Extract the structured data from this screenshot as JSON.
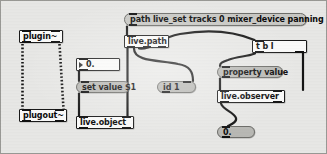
{
  "window": {
    "kind": "max-patcher",
    "background_color": "#e8e8e6",
    "border_color": "#9a9a96",
    "width": 327,
    "height": 154
  },
  "objects": {
    "plugin": {
      "text": "plugin~",
      "type": "object",
      "x": 19,
      "y": 30,
      "w": 44,
      "h": 13,
      "inlets": 2,
      "outlets": 2
    },
    "plugout": {
      "text": "plugout~",
      "type": "object",
      "x": 19,
      "y": 109,
      "w": 48,
      "h": 13,
      "inlets": 2,
      "outlets": 0
    },
    "numberbox": {
      "text": "0.",
      "type": "number",
      "x": 76,
      "y": 58,
      "w": 44,
      "h": 13,
      "inlets": 1,
      "outlets": 1
    },
    "set_value": {
      "text": "set value $1",
      "type": "message",
      "x": 76,
      "y": 81,
      "w": 54,
      "h": 12,
      "inlets": 1,
      "outlets": 1
    },
    "live_object": {
      "text": "live.object",
      "type": "object",
      "x": 76,
      "y": 116,
      "w": 58,
      "h": 13,
      "inlets": 2,
      "outlets": 2
    },
    "path_message": {
      "text": "path live_set tracks 0 mixer_device panning",
      "type": "message",
      "x": 124,
      "y": 13,
      "w": 183,
      "h": 13,
      "inlets": 1,
      "outlets": 1
    },
    "live_path": {
      "text": "live.path",
      "type": "object",
      "x": 124,
      "y": 35,
      "w": 45,
      "h": 13,
      "inlets": 1,
      "outlets": 3
    },
    "id_1": {
      "text": "id 1",
      "type": "message",
      "x": 157,
      "y": 81,
      "w": 39,
      "h": 12,
      "inlets": 1,
      "outlets": 1
    },
    "t_b_l": {
      "text": "t b l",
      "type": "object",
      "x": 252,
      "y": 40,
      "w": 55,
      "h": 13,
      "inlets": 1,
      "outlets": 2
    },
    "property_value": {
      "text": "property value",
      "type": "message",
      "x": 217,
      "y": 66,
      "w": 66,
      "h": 12,
      "inlets": 1,
      "outlets": 1
    },
    "live_observer": {
      "text": "live.observer",
      "type": "object",
      "x": 217,
      "y": 90,
      "w": 68,
      "h": 13,
      "inlets": 2,
      "outlets": 2
    },
    "observer_output": {
      "text": "0.",
      "type": "message",
      "x": 217,
      "y": 126,
      "w": 38,
      "h": 12,
      "inlets": 1,
      "outlets": 1
    }
  },
  "connections": [
    {
      "name": "plugin-left-to-plugout-left",
      "signal": true
    },
    {
      "name": "plugin-right-to-plugout-right",
      "signal": true
    },
    {
      "name": "numberbox-to-set-value",
      "signal": false
    },
    {
      "name": "set-value-to-live-object",
      "signal": false
    },
    {
      "name": "path-message-to-live-path",
      "signal": false
    },
    {
      "name": "live-path-out0-to-live-object-right",
      "signal": false
    },
    {
      "name": "live-path-out1-to-id-1",
      "signal": false
    },
    {
      "name": "live-path-out2-to-t-b-l",
      "signal": false
    },
    {
      "name": "t-b-l-out0-to-property-value",
      "signal": false
    },
    {
      "name": "t-b-l-out1-to-live-observer-right",
      "signal": false
    },
    {
      "name": "property-value-to-live-observer",
      "signal": false
    },
    {
      "name": "live-observer-to-observer-output",
      "signal": false
    }
  ]
}
